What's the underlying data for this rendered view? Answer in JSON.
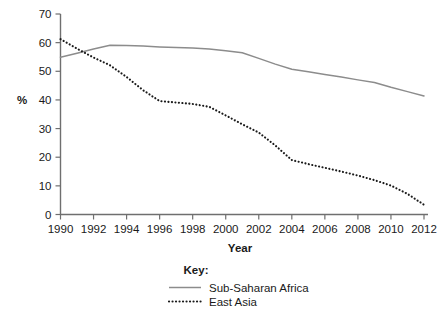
{
  "chart_data": {
    "type": "line",
    "title": "",
    "xlabel": "Year",
    "ylabel": "%",
    "xlim": [
      1990,
      2012
    ],
    "ylim": [
      0,
      70
    ],
    "grid": false,
    "legend_position": "bottom",
    "legend_title": "Key:",
    "x_ticks": [
      "1990",
      "1992",
      "1994",
      "1996",
      "1998",
      "2000",
      "2002",
      "2004",
      "2006",
      "2008",
      "2010",
      "2012"
    ],
    "y_ticks": [
      "0",
      "10",
      "20",
      "30",
      "40",
      "50",
      "60",
      "70"
    ],
    "x": [
      1990,
      1991,
      1992,
      1993,
      1994,
      1995,
      1996,
      1997,
      1998,
      1999,
      2000,
      2001,
      2002,
      2003,
      2004,
      2005,
      2006,
      2007,
      2008,
      2009,
      2010,
      2011,
      2012
    ],
    "series": [
      {
        "name": "Sub-Saharan Africa",
        "style": "solid",
        "color": "#8c8c8c",
        "values": [
          54.9,
          56.3,
          57.8,
          59.1,
          59.0,
          58.8,
          58.5,
          58.3,
          58.1,
          57.8,
          57.2,
          56.5,
          54.5,
          52.5,
          50.7,
          49.8,
          48.9,
          48.0,
          47.0,
          46.1,
          44.4,
          42.9,
          41.4
        ]
      },
      {
        "name": "East Asia",
        "style": "dotted",
        "color": "#1a1a1a",
        "values": [
          61.2,
          57.9,
          54.8,
          52.1,
          48.0,
          43.4,
          39.6,
          39.1,
          38.6,
          37.6,
          34.6,
          31.5,
          28.6,
          24.1,
          19.0,
          17.6,
          16.3,
          15.0,
          13.6,
          12.0,
          10.1,
          7.2,
          3.4
        ]
      }
    ]
  },
  "legend": {
    "title": "Key:",
    "entries": [
      {
        "label": "Sub-Saharan Africa",
        "style": "solid"
      },
      {
        "label": "East Asia",
        "style": "dotted"
      }
    ]
  }
}
